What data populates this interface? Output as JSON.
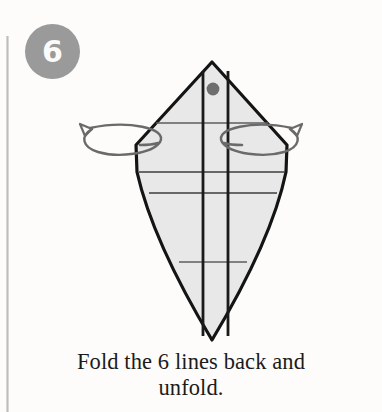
{
  "step": {
    "number": "6",
    "badge_color": "#9a9a9a",
    "badge_text_color": "#fbfbfb"
  },
  "caption": {
    "line1": "Fold the 6 lines back and",
    "line2": "unfold.",
    "full_text": "Fold the 6 lines back and unfold.",
    "color": "#1b1b1b"
  },
  "diagram": {
    "type": "origami-fold-step",
    "paper_fill": "#e8e8e8",
    "paper_outline": "#141414",
    "crease_major_color": "#1a1a1a",
    "crease_minor_color": "#6b6b6b",
    "marker_dot_color": "#6e6e6e",
    "outline_points": "212,62 136,145 136,170 212,340 287,170 287,145",
    "shape": {
      "apex": [
        212,
        62
      ],
      "left_vertex": [
        136,
        145
      ],
      "right_vertex": [
        287,
        145
      ],
      "bottom_tip": [
        212,
        340
      ]
    },
    "marker_dot": {
      "cx": 212,
      "cy": 89,
      "r": 6.5
    },
    "vertical_creases": [
      {
        "x": 203,
        "y1": 72,
        "y2": 334,
        "weight": "major"
      },
      {
        "x": 228,
        "y1": 72,
        "y2": 334,
        "weight": "major"
      }
    ],
    "horizontal_creases": [
      {
        "y": 123,
        "x1": 155,
        "x2": 268,
        "weight": "minor"
      },
      {
        "y": 172,
        "x1": 138,
        "x2": 285,
        "weight": "minor"
      },
      {
        "y": 193,
        "x1": 148,
        "x2": 278,
        "weight": "minor"
      },
      {
        "y": 262,
        "x1": 178,
        "x2": 248,
        "weight": "minor"
      }
    ],
    "arrows": [
      {
        "name": "fold-back-arrow-left",
        "direction": "left",
        "description": "curved wrap-around arrow indicating fold behind on left side"
      },
      {
        "name": "fold-back-arrow-right",
        "direction": "right",
        "description": "curved wrap-around arrow indicating fold behind on right side"
      }
    ],
    "arrow_color": "#6a6a6a"
  },
  "background": {
    "page_color": "#fdfcfa",
    "margin_rule_color": "#c4c4c4"
  }
}
